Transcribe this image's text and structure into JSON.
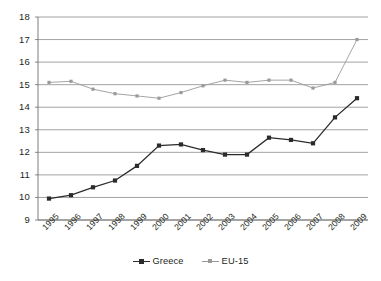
{
  "chart_data": {
    "type": "line",
    "title": "",
    "subtitle": "",
    "xlabel": "",
    "ylabel": "",
    "categories": [
      "1995",
      "1996",
      "1997",
      "1998",
      "1999",
      "2000",
      "2001",
      "2002",
      "2003",
      "2004",
      "2005",
      "2006",
      "2007",
      "2008",
      "2009"
    ],
    "ylim": [
      9,
      18
    ],
    "yticks": [
      9,
      10,
      11,
      12,
      13,
      14,
      15,
      16,
      17,
      18
    ],
    "ytick_labels": [
      "9",
      "10",
      "11",
      "12",
      "13",
      "14",
      "15",
      "16",
      "17",
      "18"
    ],
    "grid": true,
    "grid_axis": "y",
    "legend_position": "bottom-center",
    "series": [
      {
        "name": "Greece",
        "color": "#2b2b2b",
        "marker": "square",
        "values": [
          9.95,
          10.1,
          10.45,
          10.75,
          11.4,
          12.3,
          12.35,
          12.1,
          11.9,
          11.9,
          12.65,
          12.55,
          12.4,
          13.55,
          14.4
        ]
      },
      {
        "name": "EU-15",
        "color": "#9a9a9a",
        "marker": "square",
        "values": [
          15.1,
          15.15,
          14.8,
          14.6,
          14.5,
          14.4,
          14.65,
          14.95,
          15.2,
          15.1,
          15.2,
          15.2,
          14.85,
          15.1,
          17.0
        ]
      }
    ]
  },
  "legend": {
    "items": [
      {
        "label": "Greece",
        "key": "greece"
      },
      {
        "label": "EU-15",
        "key": "eu15"
      }
    ]
  },
  "colors": {
    "greece": "#2b2b2b",
    "eu15": "#9a9a9a",
    "grid": "#8c8c8c",
    "axis": "#6d6d6d",
    "text": "#231f20",
    "background": "#ffffff"
  }
}
